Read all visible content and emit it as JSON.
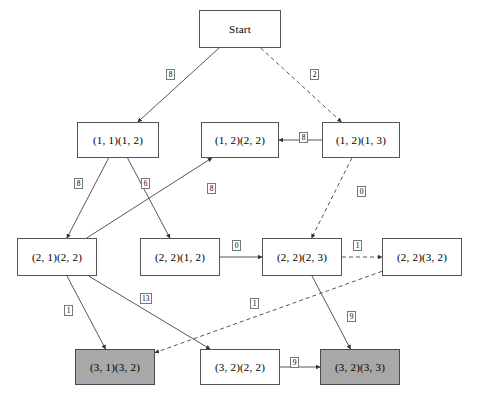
{
  "diagram": {
    "background_color": "#ffffff",
    "node_fill": "#ffffff",
    "goal_fill": "#a8a8a8",
    "stroke_color": "#555555",
    "nodes": [
      {
        "id": "start",
        "label": "Start",
        "x": 199,
        "y": 10,
        "w": 82,
        "h": 38,
        "goal": false
      },
      {
        "id": "n11_12",
        "label": "(1, 1)(1, 2)",
        "x": 77,
        "y": 122,
        "w": 82,
        "h": 36,
        "goal": false
      },
      {
        "id": "n12_22",
        "label": "(1, 2)(2, 2)",
        "x": 201,
        "y": 122,
        "w": 78,
        "h": 36,
        "goal": false
      },
      {
        "id": "n12_13",
        "label": "(1, 2)(1, 3)",
        "x": 322,
        "y": 122,
        "w": 78,
        "h": 36,
        "goal": false
      },
      {
        "id": "n21_22",
        "label": "(2, 1)(2, 2)",
        "x": 17,
        "y": 238,
        "w": 80,
        "h": 38,
        "goal": false
      },
      {
        "id": "n22_12",
        "label": "(2, 2)(1, 2)",
        "x": 140,
        "y": 238,
        "w": 80,
        "h": 38,
        "goal": false
      },
      {
        "id": "n22_23",
        "label": "(2, 2)(2, 3)",
        "x": 262,
        "y": 238,
        "w": 80,
        "h": 38,
        "goal": false
      },
      {
        "id": "n22_32",
        "label": "(2, 2)(3, 2)",
        "x": 382,
        "y": 238,
        "w": 80,
        "h": 38,
        "goal": false
      },
      {
        "id": "n31_32",
        "label": "(3, 1)(3, 2)",
        "x": 75,
        "y": 349,
        "w": 80,
        "h": 36,
        "goal": true
      },
      {
        "id": "n32_22",
        "label": "(3, 2)(2, 2)",
        "x": 200,
        "y": 349,
        "w": 80,
        "h": 36,
        "goal": false
      },
      {
        "id": "n32_33",
        "label": "(3, 2)(3, 3)",
        "x": 320,
        "y": 349,
        "w": 80,
        "h": 36,
        "goal": true
      }
    ],
    "edges": [
      {
        "id": "e1",
        "from": "start",
        "to": "n11_12",
        "weight": "8",
        "style": "solid",
        "label_x": 166,
        "label_y": 69
      },
      {
        "id": "e2",
        "from": "start",
        "to": "n12_13",
        "weight": "2",
        "style": "dashed",
        "label_x": 310,
        "label_y": 69
      },
      {
        "id": "e3",
        "from": "n12_13",
        "to": "n12_22",
        "weight": "8",
        "style": "solid",
        "label_x": 299,
        "label_y": 132
      },
      {
        "id": "e4",
        "from": "n11_12",
        "to": "n21_22",
        "weight": "8",
        "style": "solid",
        "label_x": 74,
        "label_y": 178
      },
      {
        "id": "e5",
        "from": "n11_12",
        "to": "n22_12",
        "weight": "6",
        "style": "solid",
        "label_x": 141,
        "label_y": 178
      },
      {
        "id": "e6",
        "from": "n21_22",
        "to": "n12_22",
        "weight": "8",
        "style": "solid",
        "label_x": 207,
        "label_y": 183
      },
      {
        "id": "e7",
        "from": "n12_13",
        "to": "n22_23",
        "weight": "0",
        "style": "dashed",
        "label_x": 357,
        "label_y": 186
      },
      {
        "id": "e8",
        "from": "n22_12",
        "to": "n22_23",
        "weight": "0",
        "style": "solid",
        "label_x": 232,
        "label_y": 240
      },
      {
        "id": "e9",
        "from": "n22_23",
        "to": "n22_32",
        "weight": "1",
        "style": "dashed",
        "label_x": 353,
        "label_y": 240
      },
      {
        "id": "e10",
        "from": "n21_22",
        "to": "n31_32",
        "weight": "1",
        "style": "solid",
        "label_x": 64,
        "label_y": 305
      },
      {
        "id": "e11",
        "from": "n21_22",
        "to": "n32_22",
        "weight": "13",
        "style": "solid",
        "label_x": 140,
        "label_y": 293
      },
      {
        "id": "e12",
        "from": "n22_32",
        "to": "n31_32",
        "weight": "1",
        "style": "dashed",
        "label_x": 250,
        "label_y": 298
      },
      {
        "id": "e13",
        "from": "n22_23",
        "to": "n32_33",
        "weight": "9",
        "style": "solid",
        "label_x": 347,
        "label_y": 311
      },
      {
        "id": "e14",
        "from": "n32_22",
        "to": "n32_33",
        "weight": "9",
        "style": "solid",
        "label_x": 290,
        "label_y": 357
      }
    ]
  }
}
